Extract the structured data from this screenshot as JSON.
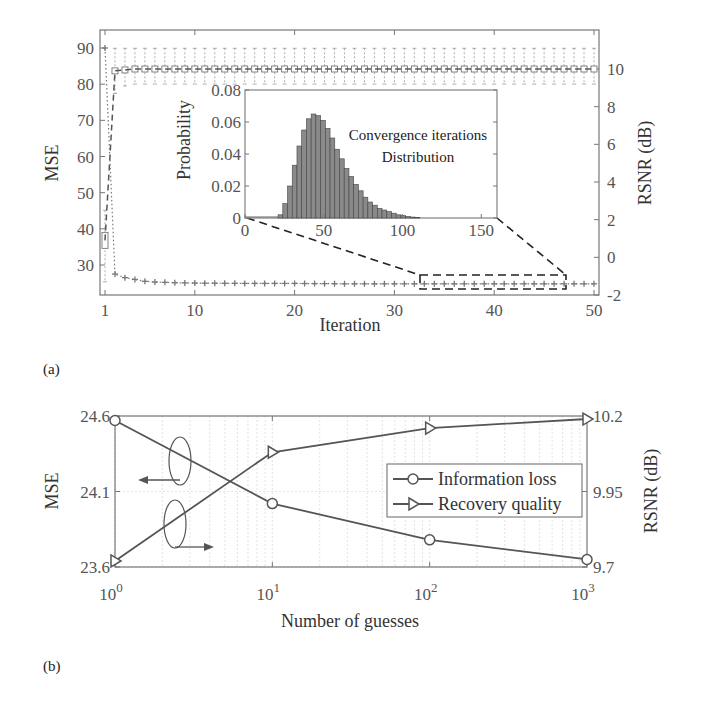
{
  "chart_data": [
    {
      "id": "a",
      "panel_label": "(a)",
      "type": "box+line",
      "title": "",
      "xlabel": "Iteration",
      "ylabel_left": "MSE",
      "ylabel_right": "RSNR (dB)",
      "xlim": [
        1,
        50
      ],
      "ylim_left": [
        22,
        95
      ],
      "ylim_right": [
        -2,
        11.5
      ],
      "x_ticks": [
        "1",
        "10",
        "20",
        "30",
        "40",
        "50"
      ],
      "y_ticks_left": [
        "30",
        "40",
        "50",
        "60",
        "70",
        "80",
        "90"
      ],
      "y_ticks_right": [
        "-2",
        "0",
        "2",
        "4",
        "6",
        "8",
        "10"
      ],
      "grid": false,
      "series": [
        {
          "name": "MSE (median, boxplot)",
          "axis": "left",
          "style": "dotted line with + markers",
          "x": [
            1,
            2,
            3,
            4,
            5,
            6,
            8,
            10,
            15,
            20,
            25,
            30,
            35,
            40,
            45,
            50
          ],
          "values": [
            90,
            27.5,
            26.5,
            26,
            25.5,
            25.3,
            25.1,
            25,
            24.9,
            24.9,
            24.8,
            24.8,
            24.8,
            24.8,
            24.8,
            24.8
          ]
        },
        {
          "name": "RSNR (median, boxplot)",
          "axis": "right",
          "style": "dashed line with box markers",
          "x": [
            1,
            2,
            3,
            4,
            5,
            6,
            8,
            10,
            15,
            20,
            25,
            30,
            35,
            40,
            45,
            50
          ],
          "values": [
            0.9,
            9.9,
            9.95,
            10.0,
            10.0,
            10.0,
            10.0,
            10.0,
            10.0,
            10.0,
            10.0,
            10.0,
            10.0,
            10.0,
            10.0,
            10.0
          ],
          "whisker_low": [
            -1.3,
            8.7,
            9.1,
            9.2,
            9.2,
            9.2,
            9.2,
            9.2,
            9.2,
            9.2,
            9.2,
            9.2,
            9.2,
            9.2,
            9.2,
            9.2
          ],
          "whisker_high": [
            2.5,
            11.1,
            11.1,
            11.1,
            11.1,
            11.1,
            11.1,
            11.1,
            11.1,
            11.1,
            11.1,
            11.1,
            11.1,
            11.1,
            11.1,
            11.1
          ]
        }
      ],
      "zoom_box": {
        "x_range": [
          32,
          46.5
        ],
        "note": "dashed rectangle with dashed connector lines to inset"
      },
      "inset": {
        "type": "bar",
        "ylabel": "Probability",
        "annotation": [
          "Convergence iterations",
          "Distribution"
        ],
        "xlim": [
          0,
          160
        ],
        "ylim": [
          0,
          0.08
        ],
        "x_ticks": [
          "0",
          "50",
          "100",
          "150"
        ],
        "y_ticks": [
          "0",
          "0.02",
          "0.04",
          "0.06",
          "0.08"
        ],
        "bin_width": 3,
        "bin_starts": [
          21,
          24,
          27,
          30,
          33,
          36,
          39,
          42,
          45,
          48,
          51,
          54,
          57,
          60,
          63,
          66,
          69,
          72,
          75,
          78,
          81,
          84,
          87,
          90,
          93,
          96,
          99,
          102,
          105,
          108
        ],
        "values": [
          0.002,
          0.009,
          0.02,
          0.033,
          0.045,
          0.055,
          0.062,
          0.065,
          0.064,
          0.061,
          0.056,
          0.05,
          0.043,
          0.037,
          0.031,
          0.026,
          0.021,
          0.017,
          0.013,
          0.01,
          0.008,
          0.006,
          0.005,
          0.004,
          0.003,
          0.002,
          0.0015,
          0.001,
          0.0006,
          0.0003
        ]
      }
    },
    {
      "id": "b",
      "panel_label": "(b)",
      "type": "line",
      "title": "",
      "xlabel": "Number of guesses",
      "ylabel_left": "MSE",
      "ylabel_right": "RSNR (dB)",
      "xscale": "log",
      "x": [
        1,
        10,
        100,
        1000
      ],
      "x_ticks": [
        "10^0",
        "10^1",
        "10^2",
        "10^3"
      ],
      "ylim_left": [
        23.6,
        24.6
      ],
      "ylim_right": [
        9.7,
        10.2
      ],
      "y_ticks_left": [
        "23.6",
        "24.1",
        "24.6"
      ],
      "y_ticks_right": [
        "9.7",
        "9.95",
        "10.2"
      ],
      "grid": true,
      "legend_position": "center-right",
      "series": [
        {
          "name": "Information loss",
          "axis": "left",
          "marker": "circle",
          "values": [
            24.57,
            24.02,
            23.78,
            23.65
          ]
        },
        {
          "name": "Recovery quality",
          "axis": "right",
          "marker": "triangle-right",
          "values": [
            9.72,
            10.08,
            10.16,
            10.19
          ]
        }
      ],
      "annotations": [
        "ellipse with arrow pointing left (MSE axis)",
        "ellipse with arrow pointing right (RSNR axis)"
      ]
    }
  ],
  "labels": {
    "a_panel": "(a)",
    "b_panel": "(b)",
    "a_xlabel": "Iteration",
    "a_ylabel_left": "MSE",
    "a_ylabel_right": "RSNR (dB)",
    "inset_ylabel": "Probability",
    "inset_ann1": "Convergence iterations",
    "inset_ann2": "Distribution",
    "b_xlabel": "Number of guesses",
    "b_ylabel_left": "MSE",
    "b_ylabel_right": "RSNR (dB)",
    "legend1": "Information loss",
    "legend2": "Recovery quality",
    "b_x_base": "10",
    "b_x_exp": [
      "0",
      "1",
      "2",
      "3"
    ]
  },
  "colors": {
    "axis": "#555555",
    "series_dark": "#555555",
    "histogram_fill": "#8a8a8a",
    "grid": "#dcdcdc"
  }
}
